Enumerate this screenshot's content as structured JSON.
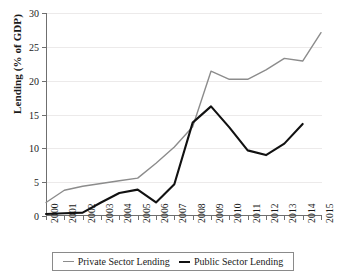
{
  "chart_data": {
    "type": "line",
    "title": "",
    "subtitle": "",
    "xlabel": "",
    "ylabel": "Lending (% of GDP)",
    "categories": [
      "2000",
      "2001",
      "2002",
      "2003",
      "2004",
      "2005",
      "2006",
      "2007",
      "2008",
      "2009",
      "2010",
      "2011",
      "2012",
      "2013",
      "2014",
      "2015"
    ],
    "x": [
      2000,
      2001,
      2002,
      2003,
      2004,
      2005,
      2006,
      2007,
      2008,
      2009,
      2010,
      2011,
      2012,
      2013,
      2014,
      2015
    ],
    "xlim": [
      2000,
      2015
    ],
    "ylim": [
      0,
      30
    ],
    "yticks": [
      0,
      5,
      10,
      15,
      20,
      25,
      30
    ],
    "ytick_labels": [
      "0",
      "5",
      "10",
      "15",
      "20",
      "25",
      "30"
    ],
    "grid": true,
    "legend_position": "bottom",
    "series": [
      {
        "name": "Private Sector Lending",
        "color": "#8c8c8c",
        "values": [
          2.0,
          3.8,
          4.4,
          4.8,
          5.2,
          5.6,
          7.8,
          10.2,
          13.2,
          21.4,
          20.2,
          20.2,
          21.6,
          23.3,
          22.9,
          27.1
        ]
      },
      {
        "name": "Public Sector Lending",
        "color": "#111111",
        "values": [
          0.3,
          0.4,
          0.5,
          2.0,
          3.4,
          3.9,
          2.0,
          4.7,
          13.8,
          16.2,
          13.1,
          9.7,
          9.0,
          10.7,
          13.6,
          null
        ]
      }
    ]
  },
  "legend": {
    "items": [
      {
        "label": "Private Sector Lending",
        "swatch": "private-line-swatch"
      },
      {
        "label": "Public Sector Lending",
        "swatch": "public-line-swatch"
      }
    ]
  },
  "colors": {
    "private": "#8c8c8c",
    "public": "#111111",
    "axis": "#6f6f6f",
    "grid": "#eceaea",
    "background": "#ffffff"
  }
}
